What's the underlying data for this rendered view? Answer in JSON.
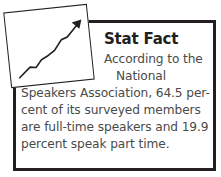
{
  "sidebar_box": {
    "icon": "trend-chart-icon",
    "title": "Stat Fact",
    "body_lines": [
      "According to the",
      "National",
      "Speakers Association, 64.5 per-",
      "cent of its surveyed members",
      "are full-time speakers and 19.9",
      "percent speak part time."
    ]
  }
}
